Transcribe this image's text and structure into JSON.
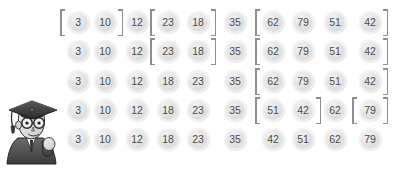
{
  "figure": {
    "background_color": "#ffffff",
    "token_text_color": "#4a4a4a",
    "token_fill_color": "#e3e3e3",
    "bracket_color": "#8e8e8e"
  },
  "mascot": {
    "name": "graduate-character",
    "description": "Cartoon graduate wearing mortarboard cap, glasses and academic gown",
    "colors": {
      "cap": "#3f3f3f",
      "face": "#d8d8d8",
      "gown": "#4a4a4a",
      "outline": "#2e2e2e"
    }
  },
  "columns_x": [
    78,
    105,
    137,
    168,
    198,
    235,
    273,
    303,
    335,
    370
  ],
  "rows_y": [
    23,
    52,
    82,
    111,
    140
  ],
  "rows": [
    {
      "index": 1,
      "values": [
        3,
        10,
        12,
        23,
        18,
        35,
        62,
        79,
        51,
        42
      ],
      "groups": [
        {
          "start": 0,
          "end": 1
        },
        {
          "start": 3,
          "end": 4
        },
        {
          "start": 6,
          "end": 9
        }
      ]
    },
    {
      "index": 2,
      "values": [
        3,
        10,
        12,
        23,
        18,
        35,
        62,
        79,
        51,
        42
      ],
      "groups": [
        {
          "start": 3,
          "end": 4
        },
        {
          "start": 6,
          "end": 9
        }
      ]
    },
    {
      "index": 3,
      "values": [
        3,
        10,
        12,
        18,
        23,
        35,
        62,
        79,
        51,
        42
      ],
      "groups": [
        {
          "start": 6,
          "end": 9
        }
      ]
    },
    {
      "index": 4,
      "values": [
        3,
        10,
        12,
        18,
        23,
        35,
        51,
        42,
        62,
        79
      ],
      "groups": [
        {
          "start": 6,
          "end": 7
        },
        {
          "start": 9,
          "end": 9
        }
      ]
    },
    {
      "index": 5,
      "values": [
        3,
        10,
        12,
        18,
        23,
        35,
        42,
        51,
        62,
        79
      ],
      "groups": []
    }
  ]
}
